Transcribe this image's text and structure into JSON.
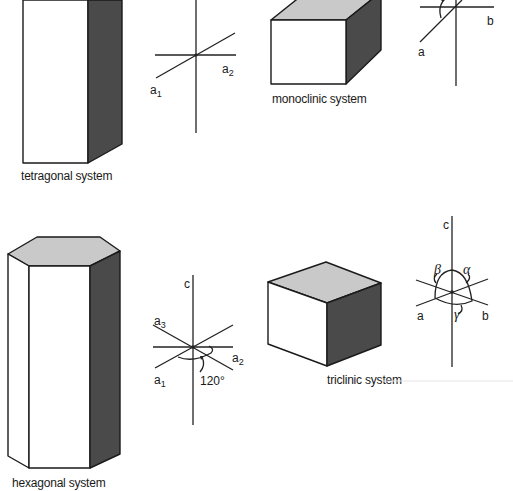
{
  "colors": {
    "background": "#ffffff",
    "light_face": "#ffffff",
    "top_face": "#c9c9c9",
    "dark_face": "#4a4a4a",
    "line": "#1a1a1a"
  },
  "panels": {
    "tetragonal": {
      "caption": "tetragonal system",
      "axis_labels": {
        "a1": "a",
        "a1_sub": "1",
        "a2": "a",
        "a2_sub": "2"
      }
    },
    "monoclinic": {
      "caption": "monoclinic system",
      "axis_labels": {
        "a": "a",
        "b": "b"
      }
    },
    "hexagonal": {
      "caption": "hexagonal system",
      "axis_labels": {
        "c": "c",
        "a1": "a",
        "a1_sub": "1",
        "a2": "a",
        "a2_sub": "2",
        "a3": "a",
        "a3_sub": "3"
      },
      "angle_label": "120°"
    },
    "triclinic": {
      "caption": "triclinic system",
      "axis_labels": {
        "c": "c",
        "a": "a",
        "b": "b"
      },
      "angle_labels": {
        "alpha": "α",
        "beta": "β",
        "gamma": "γ"
      }
    }
  }
}
